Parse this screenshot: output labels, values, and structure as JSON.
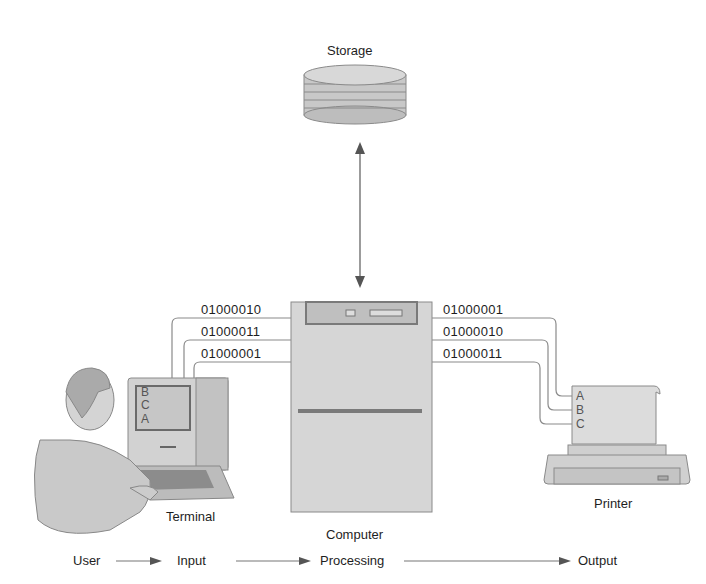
{
  "diagram": {
    "storage": {
      "label": "Storage",
      "icon": "disk-stack-icon"
    },
    "computer": {
      "label_line1": "Computer",
      "label_line2": "Processing"
    },
    "terminal": {
      "label": "Terminal",
      "screen_letters": [
        "B",
        "C",
        "A"
      ]
    },
    "printer": {
      "label": "Printer",
      "paper_letters": [
        "A",
        "B",
        "C"
      ]
    },
    "input_signals": [
      "01000010",
      "01000011",
      "01000001"
    ],
    "output_signals": [
      "01000001",
      "01000010",
      "01000011"
    ],
    "flow": {
      "steps": [
        "User",
        "Input",
        "Processing",
        "Output"
      ],
      "processing_prefix": "Computer"
    },
    "colors": {
      "wire": "#8a8a8a",
      "device_fill": "#d6d6d6",
      "device_dark": "#7a7a7a",
      "text": "#1e1e1e"
    }
  }
}
